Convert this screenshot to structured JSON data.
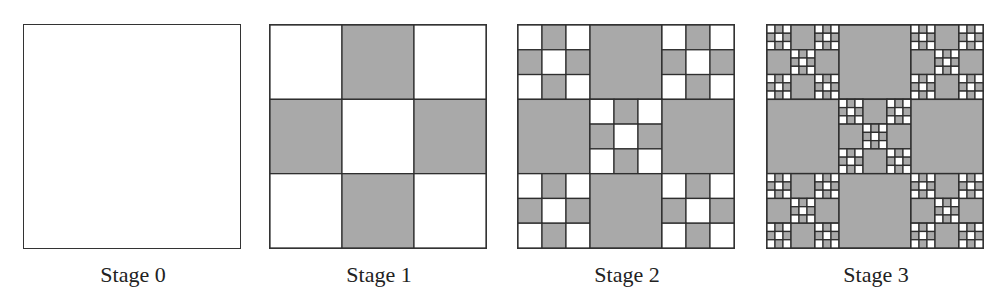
{
  "figure": {
    "colors": {
      "fill": "#a9a9a9",
      "blank": "#ffffff",
      "stroke": "#2e2e2e"
    },
    "stages": [
      {
        "label": "Stage 0",
        "depth": 0
      },
      {
        "label": "Stage 1",
        "depth": 1
      },
      {
        "label": "Stage 2",
        "depth": 2
      },
      {
        "label": "Stage 3",
        "depth": 3
      }
    ]
  }
}
